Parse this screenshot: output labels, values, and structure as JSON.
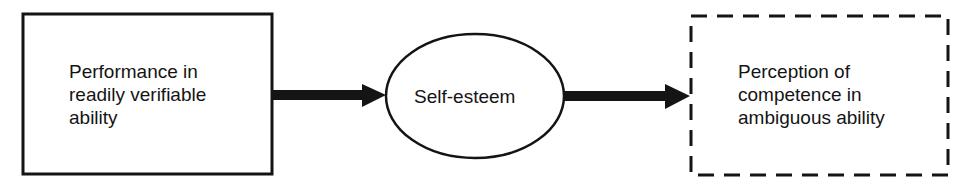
{
  "diagram": {
    "nodes": [
      {
        "id": "performance",
        "shape": "rectangle",
        "border": "solid",
        "text": "Performance in\nreadily verifiable\nability"
      },
      {
        "id": "self_esteem",
        "shape": "ellipse",
        "border": "solid",
        "text": "Self-esteem"
      },
      {
        "id": "perception",
        "shape": "rectangle",
        "border": "dashed",
        "text": "Perception of\ncompetence in\nambiguous ability"
      }
    ],
    "edges": [
      {
        "from": "performance",
        "to": "self_esteem"
      },
      {
        "from": "self_esteem",
        "to": "perception"
      }
    ],
    "colors": {
      "stroke": "#141414",
      "background": "#ffffff"
    }
  }
}
